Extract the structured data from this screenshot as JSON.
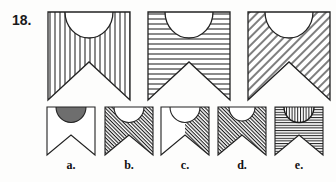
{
  "question": {
    "number": "18.",
    "type": "visual-analogy-pattern-series"
  },
  "stem": {
    "name": "sequence-row",
    "items": [
      {
        "id": "stem-1",
        "name": "stem-figure-1",
        "outer_fill": "vertical-hatch",
        "inner_fill": "white",
        "shape": "pennant-with-semicircle"
      },
      {
        "id": "stem-2",
        "name": "stem-figure-2",
        "outer_fill": "horizontal-hatch",
        "inner_fill": "white",
        "shape": "pennant-with-semicircle"
      },
      {
        "id": "stem-3",
        "name": "stem-figure-3",
        "outer_fill": "diagonal-hatch-up",
        "inner_fill": "white",
        "shape": "pennant-with-semicircle"
      }
    ]
  },
  "options": {
    "name": "answer-options-row",
    "items": [
      {
        "id": "opt-a",
        "label": "a.",
        "name": "option-a",
        "outer_fill": "white",
        "inner_fill": "solid-gray",
        "half": "both"
      },
      {
        "id": "opt-b",
        "label": "b.",
        "name": "option-b",
        "outer_fill": "dense-diagonal-hatch-down",
        "inner_fill": "white",
        "half": "both"
      },
      {
        "id": "opt-c",
        "label": "c.",
        "name": "option-c",
        "outer_fill": "dense-diagonal-hatch-down",
        "inner_fill": "white",
        "half": "right-only"
      },
      {
        "id": "opt-d",
        "label": "d.",
        "name": "option-d",
        "outer_fill": "dense-diagonal-hatch-down",
        "inner_fill": "white",
        "half": "both"
      },
      {
        "id": "opt-e",
        "label": "e.",
        "name": "option-e",
        "outer_fill": "horizontal-hatch",
        "inner_fill": "vertical-hatch",
        "half": "both"
      }
    ]
  },
  "colors": {
    "ink": "#1a1a1a",
    "stroke": "#222222",
    "solid_gray": "#6e6e6e",
    "paper": "#fdfdfc"
  }
}
